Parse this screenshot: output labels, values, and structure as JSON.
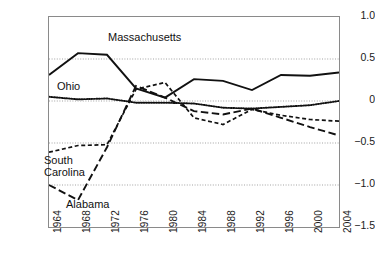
{
  "chart_data": {
    "type": "line",
    "title": "",
    "xlabel": "",
    "ylabel": "",
    "x": [
      1964,
      1968,
      1972,
      1976,
      1980,
      1984,
      1988,
      1992,
      1996,
      2000,
      2004
    ],
    "categories": [
      "1964",
      "1968",
      "1972",
      "1976",
      "1980",
      "1984",
      "1988",
      "1992",
      "1996",
      "2000",
      "2004"
    ],
    "xlim": [
      1964,
      2004
    ],
    "ylim": [
      -1.5,
      1.0
    ],
    "yticks": [
      1.0,
      0.5,
      0,
      -0.5,
      -1.0,
      -1.5
    ],
    "ytick_labels": [
      "1.0",
      "0.5",
      "0",
      "−0.5",
      "−1.0",
      "−1.5"
    ],
    "grid": true,
    "grid_style": "dotted",
    "legend": "inline-annotations",
    "series": [
      {
        "name": "Massachusetts",
        "style": "solid",
        "color": "#111111",
        "values": [
          0.31,
          0.57,
          0.55,
          0.15,
          0.04,
          0.26,
          0.24,
          0.13,
          0.31,
          0.3,
          0.34
        ]
      },
      {
        "name": "Ohio",
        "style": "dotted",
        "color": "#111111",
        "values": [
          0.05,
          0.02,
          0.03,
          -0.02,
          -0.02,
          -0.03,
          -0.08,
          -0.09,
          -0.07,
          -0.05,
          0.0
        ]
      },
      {
        "name": "South Carolina",
        "style": "short-dash",
        "color": "#111111",
        "values": [
          -0.61,
          -0.53,
          -0.52,
          0.14,
          0.22,
          -0.2,
          -0.28,
          -0.1,
          -0.17,
          -0.22,
          -0.24
        ]
      },
      {
        "name": "Alabama",
        "style": "long-dash",
        "color": "#111111",
        "values": [
          -1.0,
          -1.18,
          -0.55,
          0.18,
          0.04,
          -0.12,
          -0.16,
          -0.09,
          -0.2,
          -0.31,
          -0.41
        ]
      }
    ],
    "annotations": [
      {
        "name": "Massachusetts",
        "text": "Massachusetts"
      },
      {
        "name": "Ohio",
        "text": "Ohio"
      },
      {
        "name": "South Carolina",
        "text": "South\nCarolina"
      },
      {
        "name": "Alabama",
        "text": "Alabama"
      }
    ]
  },
  "colors": {
    "axis": "#8a8a8a",
    "grid": "#999999",
    "line": "#111111",
    "text": "#1a1a1a",
    "background": "#ffffff"
  }
}
